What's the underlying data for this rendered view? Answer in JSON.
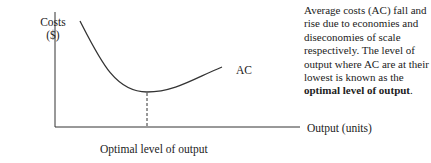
{
  "diagram": {
    "y_axis_label_line1": "Costs",
    "y_axis_label_line2": "($)",
    "x_axis_label": "Output (units)",
    "curve_label": "AC",
    "caption": "Optimal level of output",
    "note_text": "Average costs (AC) fall and rise due to economies and diseconomies of scale respectively.  The level of output where AC are at their lowest is known as the",
    "note_bold": "optimal level of output",
    "note_end": "."
  }
}
